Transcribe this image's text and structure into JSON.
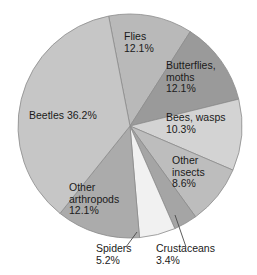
{
  "chart_data": {
    "type": "pie",
    "title": "",
    "subtitle": "",
    "xlabel": "",
    "ylabel": "",
    "legend_position": "none",
    "grid": false,
    "units": "percent",
    "total": 100.0,
    "start_angle_deg": -11,
    "direction": "clockwise",
    "categories": [
      "Flies",
      "Butterflies, moths",
      "Bees, wasps",
      "Other insects",
      "Crustaceans",
      "Spiders",
      "Other arthropods",
      "Beetles"
    ],
    "values": [
      12.1,
      12.1,
      10.3,
      8.6,
      3.4,
      5.2,
      12.1,
      36.2
    ],
    "slices": [
      {
        "name": "Flies",
        "label_lines": [
          "Flies",
          "12.1%"
        ],
        "value": 12.1,
        "value_text": "12.1%",
        "color": "#b9b9b9",
        "label_placement": "inside",
        "leader": false
      },
      {
        "name": "Butterflies, moths",
        "label_lines": [
          "Butterflies,",
          "moths",
          "12.1%"
        ],
        "value": 12.1,
        "value_text": "12.1%",
        "color": "#9a9a9a",
        "label_placement": "inside",
        "leader": false
      },
      {
        "name": "Bees, wasps",
        "label_lines": [
          "Bees, wasps",
          "10.3%"
        ],
        "value": 10.3,
        "value_text": "10.3%",
        "color": "#d3d3d3",
        "label_placement": "inside",
        "leader": false
      },
      {
        "name": "Other insects",
        "label_lines": [
          "Other",
          "insects",
          "8.6%"
        ],
        "value": 8.6,
        "value_text": "8.6%",
        "color": "#bdbdbd",
        "label_placement": "inside",
        "leader": false
      },
      {
        "name": "Crustaceans",
        "label_lines": [
          "Crustaceans",
          "3.4%"
        ],
        "value": 3.4,
        "value_text": "3.4%",
        "color": "#a5a5a5",
        "label_placement": "outside",
        "leader": true
      },
      {
        "name": "Spiders",
        "label_lines": [
          "Spiders",
          "5.2%"
        ],
        "value": 5.2,
        "value_text": "5.2%",
        "color": "#f1f1f1",
        "label_placement": "outside",
        "leader": true
      },
      {
        "name": "Other arthropods",
        "label_lines": [
          "Other",
          "arthropods",
          "12.1%"
        ],
        "value": 12.1,
        "value_text": "12.1%",
        "color": "#ababab",
        "label_placement": "inside",
        "leader": false
      },
      {
        "name": "Beetles",
        "label_lines": [
          "Beetles 36.2%"
        ],
        "value": 36.2,
        "value_text": "36.2%",
        "color": "#c6c6c6",
        "label_placement": "inside",
        "leader": false
      }
    ],
    "colors": {
      "stroke": "#8c8c8c",
      "text": "#1a1a1a",
      "leader": "#4a4a4a",
      "background": "#ffffff"
    }
  },
  "labels": {
    "flies": {
      "l1": "Flies",
      "l2": "12.1%"
    },
    "butterflies": {
      "l1": "Butterflies,",
      "l2": "moths",
      "l3": "12.1%"
    },
    "bees": {
      "l1": "Bees, wasps",
      "l2": "10.3%"
    },
    "other_insects": {
      "l1": "Other",
      "l2": "insects",
      "l3": "8.6%"
    },
    "beetles": {
      "l1": "Beetles 36.2%"
    },
    "other_arthropods": {
      "l1": "Other",
      "l2": "arthropods",
      "l3": "12.1%"
    },
    "spiders": {
      "l1": "Spiders",
      "l2": "5.2%"
    },
    "crustaceans": {
      "l1": "Crustaceans",
      "l2": "3.4%"
    }
  }
}
